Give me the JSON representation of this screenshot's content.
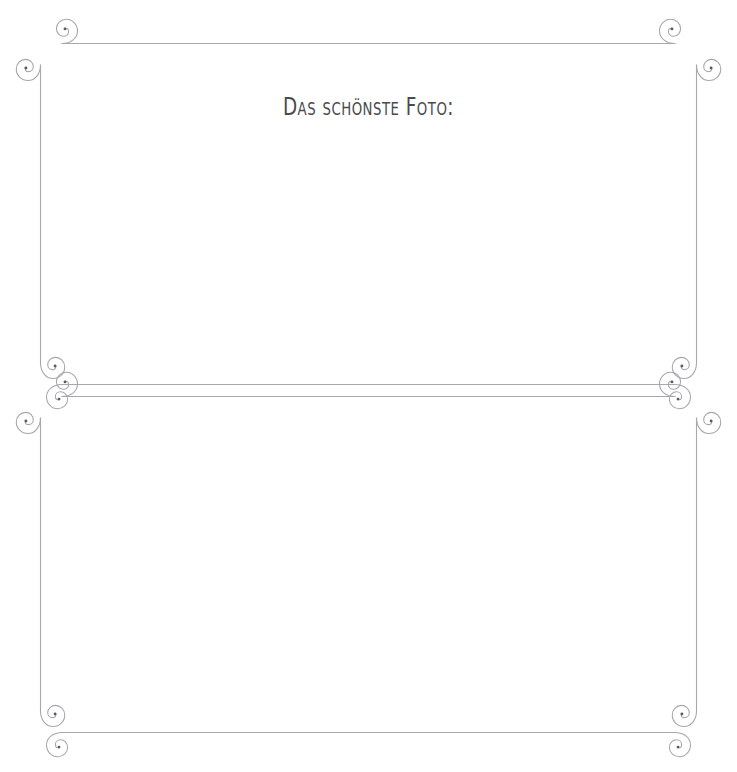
{
  "page": {
    "background_color": "#ffffff",
    "width": 737,
    "height": 772,
    "language": "de"
  },
  "title": {
    "text": "Das schönste Foto:",
    "color": "#4a4a4e",
    "align": "center"
  },
  "ornament": {
    "line_color": "#a8a8ac",
    "curl_color": "#5a5a60",
    "stroke_width": 1.1,
    "style": "flourish-scroll-corner",
    "description": "two stacked decorative frames, each corner formed by separate horizontal and vertical strokes ending in inward spiral curls"
  },
  "frames": [
    {
      "name": "upper-photo-frame",
      "left": 40,
      "top": 42,
      "right": 697,
      "bottom": 385,
      "purpose": "photo placeholder"
    },
    {
      "name": "lower-photo-frame",
      "left": 40,
      "top": 395,
      "right": 697,
      "bottom": 733,
      "purpose": "photo placeholder"
    }
  ]
}
